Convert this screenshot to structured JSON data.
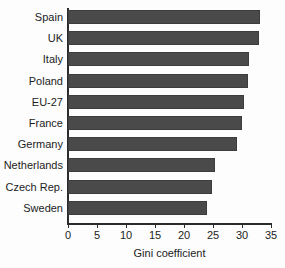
{
  "chart_data": {
    "type": "bar",
    "orientation": "horizontal",
    "title": "",
    "xlabel": "Gini coefficient",
    "ylabel": "",
    "categories": [
      "Spain",
      "UK",
      "Italy",
      "Poland",
      "EU-27",
      "France",
      "Germany",
      "Netherlands",
      "Czech Rep.",
      "Sweden"
    ],
    "values": [
      33.1,
      32.9,
      31.2,
      31.0,
      30.4,
      30.0,
      29.2,
      25.4,
      24.8,
      24.0
    ],
    "xlim": [
      0,
      35
    ],
    "xticks": [
      0,
      5,
      10,
      15,
      20,
      25,
      30,
      35
    ],
    "xtick_labels": [
      "0",
      "5",
      "10",
      "15",
      "20",
      "25",
      "30",
      "35"
    ],
    "grid": false,
    "legend": "none",
    "bar_color": "#4a4a4a",
    "axis_color": "#2b2b2b",
    "text_color": "#1c1c1c",
    "background": "#fdfdfd"
  }
}
